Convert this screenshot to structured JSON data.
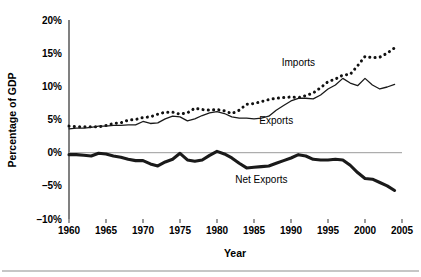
{
  "chart_data": {
    "type": "line",
    "title": "",
    "xlabel": "Year",
    "ylabel": "Percentage of GDP",
    "xlim": [
      1960,
      2005
    ],
    "ylim": [
      -10,
      20
    ],
    "grid": false,
    "legend_position": "inline-annotations",
    "y_ticks": [
      "20%",
      "15%",
      "10%",
      "5%",
      "0%",
      "–10%",
      "–5%"
    ],
    "y_tick_values": [
      20,
      15,
      10,
      5,
      0,
      -5,
      -10
    ],
    "y_tick_labels": [
      "20%",
      "15%",
      "10%",
      "5%",
      "0%",
      "–5%",
      "–10%"
    ],
    "x_ticks": [
      1960,
      1965,
      1970,
      1975,
      1980,
      1985,
      1990,
      1995,
      2000,
      2005
    ],
    "x_tick_labels": [
      "1960",
      "1965",
      "1970",
      "1975",
      "1980",
      "1985",
      "1990",
      "1995",
      "2000",
      "2005"
    ],
    "zero_line": 0,
    "x": [
      1960,
      1961,
      1962,
      1963,
      1964,
      1965,
      1966,
      1967,
      1968,
      1969,
      1970,
      1971,
      1972,
      1973,
      1974,
      1975,
      1976,
      1977,
      1978,
      1979,
      1980,
      1981,
      1982,
      1983,
      1984,
      1985,
      1986,
      1987,
      1988,
      1989,
      1990,
      1991,
      1992,
      1993,
      1994,
      1995,
      1996,
      1997,
      1998,
      1999,
      2000,
      2001,
      2002,
      2003,
      2004
    ],
    "series": [
      {
        "name": "Imports",
        "style": "dotted",
        "values": [
          4.0,
          3.9,
          3.9,
          3.9,
          3.9,
          4.1,
          4.4,
          4.5,
          4.9,
          5.0,
          5.3,
          5.4,
          5.8,
          6.1,
          6.1,
          5.8,
          6.0,
          6.7,
          6.5,
          6.4,
          6.5,
          6.3,
          5.9,
          6.4,
          7.3,
          7.4,
          7.7,
          8.0,
          8.2,
          8.3,
          8.4,
          8.3,
          8.6,
          9.0,
          9.8,
          10.7,
          11.1,
          11.7,
          11.8,
          13.1,
          14.5,
          14.3,
          14.4,
          15.0,
          15.8
        ]
      },
      {
        "name": "Exports",
        "style": "solid-thin",
        "values": [
          3.6,
          3.7,
          3.7,
          3.8,
          4.0,
          4.0,
          4.1,
          4.1,
          4.2,
          4.2,
          4.7,
          4.4,
          4.5,
          5.1,
          5.5,
          5.4,
          4.8,
          5.1,
          5.6,
          6.0,
          6.2,
          5.9,
          5.4,
          5.2,
          5.2,
          5.1,
          5.2,
          5.5,
          6.4,
          7.1,
          7.8,
          8.2,
          8.2,
          8.1,
          8.7,
          9.6,
          10.2,
          11.2,
          10.5,
          10.1,
          11.2,
          10.2,
          9.6,
          9.9,
          10.3
        ]
      },
      {
        "name": "Net Exports",
        "style": "solid-thick",
        "values": [
          -0.3,
          -0.3,
          -0.4,
          -0.5,
          -0.1,
          -0.2,
          -0.5,
          -0.7,
          -1.0,
          -1.2,
          -1.2,
          -1.7,
          -2.0,
          -1.4,
          -1.0,
          -0.1,
          -1.1,
          -1.3,
          -1.1,
          -0.4,
          0.2,
          -0.2,
          -0.8,
          -1.6,
          -2.3,
          -2.2,
          -2.1,
          -2.0,
          -1.6,
          -1.2,
          -0.8,
          -0.3,
          -0.5,
          -1.0,
          -1.1,
          -1.1,
          -1.0,
          -1.1,
          -1.9,
          -3.0,
          -3.9,
          -4.0,
          -4.5,
          -5.0,
          -5.7
        ]
      }
    ],
    "annotations": [
      {
        "text": "Imports",
        "x": 1991,
        "y": 13.0
      },
      {
        "text": "Exports",
        "x": 1988,
        "y": 4.4
      },
      {
        "text": "Net Exports",
        "x": 1986,
        "y": -4.5
      }
    ]
  },
  "axis_titles": {
    "x": "Year",
    "y": "Percentage of GDP"
  },
  "colors": {
    "ink": "#1a1a1a",
    "axis": "#4a4a4a",
    "zero_line": "#9a9a9a",
    "background": "#ffffff"
  }
}
